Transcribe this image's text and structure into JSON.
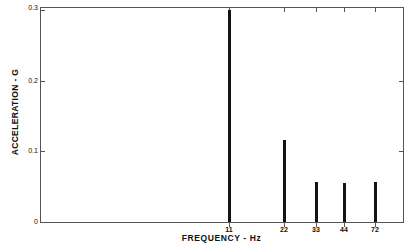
{
  "chart_data": {
    "type": "bar",
    "title": "",
    "subtitle": "",
    "xlabel": "FREQUENCY - Hz",
    "ylabel": "ACCELERATION - G",
    "categories": [
      "11",
      "22",
      "33",
      "44",
      "72"
    ],
    "x": [
      11,
      22,
      33,
      44,
      72
    ],
    "values": [
      0.296,
      0.115,
      0.056,
      0.054,
      0.056
    ],
    "xlim": [
      0,
      85
    ],
    "ylim": [
      0,
      0.3
    ],
    "yticks": [
      0,
      0.1,
      0.2,
      0.3
    ],
    "ytick_labels": [
      "0",
      "0.1",
      "0.2",
      "0.3"
    ],
    "xticks": [
      11,
      22,
      33,
      44,
      72
    ],
    "xtick_labels": [
      "11",
      "22",
      "33",
      "44",
      "72"
    ],
    "grid": false,
    "legend": null,
    "legend_position": "none",
    "bar_color": "#141414",
    "axis_color": "#555555",
    "background_color": "#ffffff",
    "annotations": []
  },
  "axes": {
    "y_axis_title": "ACCELERATION - G",
    "x_axis_title": "FREQUENCY - Hz",
    "y_tick_0": "0",
    "y_tick_1": "0.1",
    "y_tick_2": "0.2",
    "y_tick_3": "0.3",
    "x_tick_0": "11",
    "x_tick_1": "22",
    "x_tick_2": "33",
    "x_tick_3": "44",
    "x_tick_4": "72"
  }
}
